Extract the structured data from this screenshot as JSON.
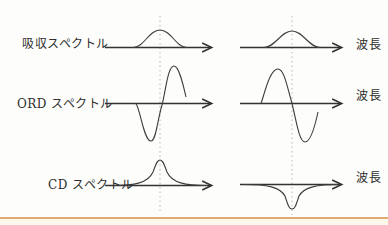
{
  "diagram": {
    "rows": [
      {
        "label": "吸収スペクトル",
        "left_curve": "positive-absorption-band",
        "right_curve": "positive-absorption-band"
      },
      {
        "label": "ORD スペクトル",
        "left_curve": "positive-cotton-effect-trough-then-peak",
        "right_curve": "negative-cotton-effect-peak-then-trough"
      },
      {
        "label": "CD スペクトル",
        "left_curve": "positive-cd-band",
        "right_curve": "negative-cd-band"
      }
    ],
    "wavelength_label": "波長",
    "guidelines": "dotted vertical lines through band centers of both columns",
    "colors": {
      "line": "#3d3d3d",
      "axis": "#333333",
      "dotted_guideline": "#b8b8b8",
      "text": "#2e2e2e",
      "accent_rule": "#d5904a",
      "background": "#fdfdfb",
      "footer_strip": "#fcf8ea"
    }
  }
}
